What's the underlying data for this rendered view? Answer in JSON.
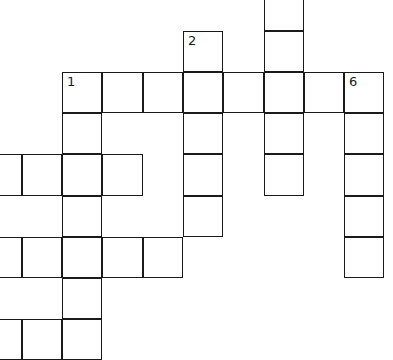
{
  "puzzle": {
    "type": "crossword",
    "cell_size": 40.5,
    "origin": {
      "x": 22.5,
      "y": 31.5
    },
    "cells": [
      {
        "col": 6,
        "row": -1
      },
      {
        "col": 4,
        "row": 0,
        "number": "2"
      },
      {
        "col": 6,
        "row": 0
      },
      {
        "col": 1,
        "row": 1,
        "number": "1"
      },
      {
        "col": 2,
        "row": 1
      },
      {
        "col": 3,
        "row": 1
      },
      {
        "col": 4,
        "row": 1
      },
      {
        "col": 5,
        "row": 1
      },
      {
        "col": 6,
        "row": 1
      },
      {
        "col": 7,
        "row": 1
      },
      {
        "col": 8,
        "row": 1,
        "number": "6"
      },
      {
        "col": 1,
        "row": 2
      },
      {
        "col": 4,
        "row": 2
      },
      {
        "col": 6,
        "row": 2
      },
      {
        "col": 8,
        "row": 2
      },
      {
        "col": -1,
        "row": 3
      },
      {
        "col": 0,
        "row": 3
      },
      {
        "col": 1,
        "row": 3
      },
      {
        "col": 2,
        "row": 3
      },
      {
        "col": 4,
        "row": 3
      },
      {
        "col": 6,
        "row": 3
      },
      {
        "col": 8,
        "row": 3
      },
      {
        "col": 1,
        "row": 4
      },
      {
        "col": 4,
        "row": 4
      },
      {
        "col": 8,
        "row": 4
      },
      {
        "col": -1,
        "row": 5
      },
      {
        "col": 0,
        "row": 5
      },
      {
        "col": 1,
        "row": 5
      },
      {
        "col": 2,
        "row": 5
      },
      {
        "col": 3,
        "row": 5
      },
      {
        "col": 8,
        "row": 5
      },
      {
        "col": 1,
        "row": 6
      },
      {
        "col": -1,
        "row": 7
      },
      {
        "col": 0,
        "row": 7
      },
      {
        "col": 1,
        "row": 7
      }
    ],
    "clue_numbers_visible": [
      "1",
      "2",
      "6"
    ]
  }
}
